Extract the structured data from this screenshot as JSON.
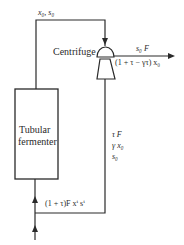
{
  "diagram": {
    "type": "process-flow",
    "nodes": [
      {
        "id": "fermenter",
        "label_line1": "Tubular",
        "label_line2": "fermenter",
        "shape": "rectangle"
      },
      {
        "id": "centrifuge",
        "label": "Centrifuge",
        "shape": "centrifuge-symbol"
      }
    ],
    "streams": {
      "fermenter_outlet": {
        "label": "x₀, s₀"
      },
      "product": {
        "line1": "s₀ F",
        "line2": "(1 + τ − γτ) x₀"
      },
      "recycle": {
        "line1": "τ F",
        "line2": "γ x₀",
        "line3": "s₀"
      },
      "feed_mixed": {
        "label": "(1 + τ)F xⁱ sⁱ"
      }
    },
    "colors": {
      "line": "#2a2a2a",
      "background": "#ffffff"
    }
  }
}
